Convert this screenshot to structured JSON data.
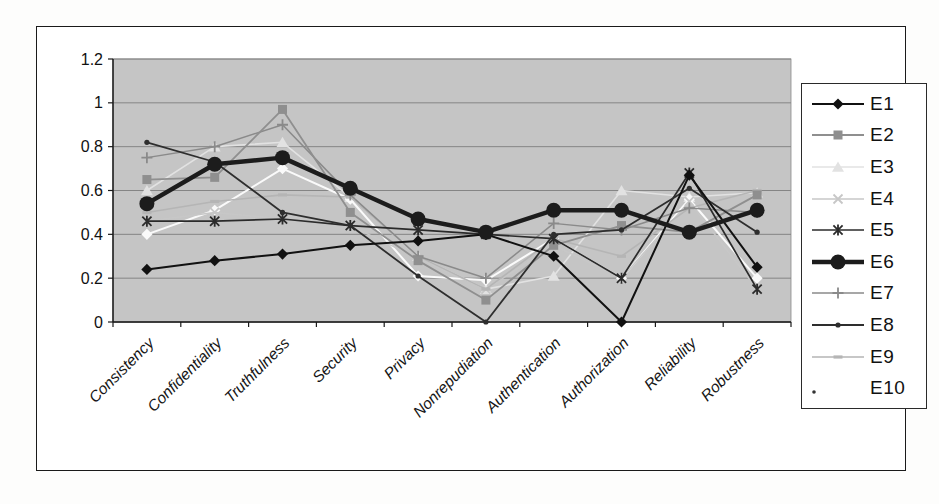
{
  "figure": {
    "title": "",
    "frame_border_color": "#1a1a1a",
    "plot_bg_color": "#c5c5c5",
    "gridline_color": "#858585",
    "axis_color": "#1a1a1a"
  },
  "legend": {
    "position": "right",
    "entries": [
      "E1",
      "E2",
      "E3",
      "E4",
      "E5",
      "E6",
      "E7",
      "E8",
      "E9",
      "E10"
    ]
  },
  "chart_data": {
    "type": "line",
    "title": "",
    "xlabel": "",
    "ylabel": "",
    "ylim": [
      0,
      1.2
    ],
    "ytick_labels": [
      "0",
      "0.2",
      "0.4",
      "0.6",
      "0.8",
      "1",
      "1.2"
    ],
    "grid": true,
    "legend_position": "right",
    "categories": [
      "Consistency",
      "Confidentiality",
      "Truthfulness",
      "Security",
      "Privacy",
      "Nonrepudiation",
      "Authentication",
      "Authorization",
      "Reliability",
      "Robustness"
    ],
    "series": [
      {
        "name": "E1",
        "color": "#111111",
        "marker": "diamond",
        "line_width": 2,
        "values": [
          0.24,
          0.28,
          0.31,
          0.35,
          0.37,
          0.4,
          0.3,
          0.0,
          0.67,
          0.25
        ]
      },
      {
        "name": "E2",
        "color": "#8f8f8f",
        "marker": "square",
        "line_width": 1.8,
        "values": [
          0.65,
          0.66,
          0.97,
          0.5,
          0.28,
          0.1,
          0.35,
          0.44,
          0.41,
          0.58
        ]
      },
      {
        "name": "E3",
        "color": "#e2e2e2",
        "marker": "triangle",
        "line_width": 1.6,
        "values": [
          0.6,
          0.8,
          0.82,
          0.57,
          0.3,
          0.15,
          0.21,
          0.6,
          0.57,
          0.59
        ]
      },
      {
        "name": "E4",
        "color": "#c7c7c7",
        "marker": "x",
        "line_width": 1.5,
        "values": [
          0.46,
          0.5,
          0.47,
          0.44,
          0.29,
          0.15,
          0.35,
          0.2,
          0.55,
          0.15
        ]
      },
      {
        "name": "E5",
        "color": "#2b2b2b",
        "marker": "asterisk",
        "line_width": 1.7,
        "values": [
          0.46,
          0.46,
          0.47,
          0.44,
          0.42,
          0.4,
          0.38,
          0.2,
          0.68,
          0.15
        ]
      },
      {
        "name": "E6",
        "color": "#1c1c1c",
        "marker": "circle",
        "line_width": 4.5,
        "values": [
          0.54,
          0.72,
          0.75,
          0.61,
          0.47,
          0.41,
          0.51,
          0.51,
          0.41,
          0.51
        ]
      },
      {
        "name": "E7",
        "color": "#8a8a8a",
        "marker": "plus",
        "line_width": 1.5,
        "values": [
          0.75,
          0.8,
          0.9,
          0.58,
          0.3,
          0.2,
          0.45,
          0.42,
          0.52,
          0.5
        ]
      },
      {
        "name": "E8",
        "color": "#2e2e2e",
        "marker": "dot",
        "line_width": 1.8,
        "values": [
          0.82,
          0.73,
          0.5,
          0.44,
          0.21,
          0.0,
          0.4,
          0.42,
          0.61,
          0.41
        ]
      },
      {
        "name": "E9",
        "color": "#b5b5b5",
        "marker": "dash",
        "line_width": 1.6,
        "values": [
          0.5,
          0.55,
          0.58,
          0.57,
          0.3,
          0.15,
          0.38,
          0.3,
          0.52,
          0.6
        ]
      },
      {
        "name": "E10",
        "color": "#fafafa",
        "marker": "diamond",
        "line_width": 2,
        "legend_dot_artifact": true,
        "values": [
          0.4,
          0.51,
          0.7,
          0.56,
          0.21,
          0.19,
          0.38,
          0.2,
          0.56,
          0.2
        ]
      }
    ]
  }
}
